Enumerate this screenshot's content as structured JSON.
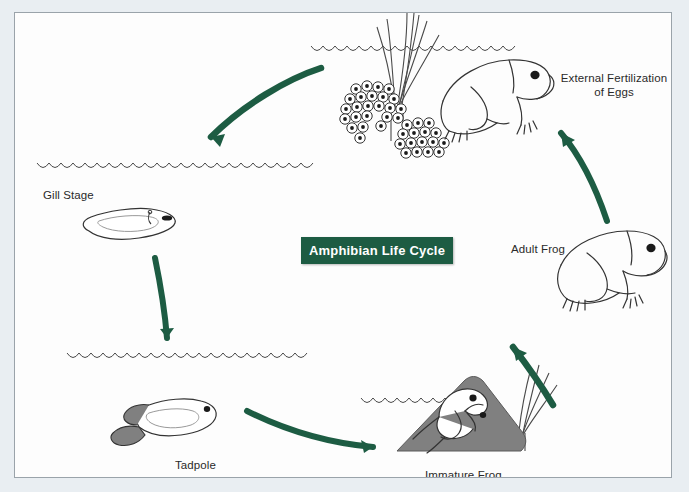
{
  "diagram": {
    "title": "Amphibian Life Cycle",
    "title_color": "#1d5c43",
    "background_color": "#fdfdfd",
    "page_background_color": "#e9eef2",
    "arrow_color": "#1d5c43",
    "ink_color": "#2a2a2a",
    "shade_color": "#808080",
    "type": "cycle",
    "stages": [
      {
        "id": "eggs",
        "label_line1": "External Fertilization",
        "label_line2": "of Eggs",
        "label": "External Fertilization of Eggs",
        "position": "top"
      },
      {
        "id": "adult-frog",
        "label": "Adult Frog",
        "position": "right"
      },
      {
        "id": "immature-frog",
        "label": "Immature Frog",
        "position": "bottom-right"
      },
      {
        "id": "tadpole",
        "label": "Tadpole",
        "position": "bottom-left"
      },
      {
        "id": "gill-stage",
        "label": "Gill Stage",
        "position": "left"
      }
    ],
    "arrows": [
      {
        "from": "eggs",
        "to": "gill-stage"
      },
      {
        "from": "gill-stage",
        "to": "tadpole"
      },
      {
        "from": "tadpole",
        "to": "immature-frog"
      },
      {
        "from": "immature-frog",
        "to": "adult-frog"
      },
      {
        "from": "adult-frog",
        "to": "eggs"
      }
    ]
  }
}
